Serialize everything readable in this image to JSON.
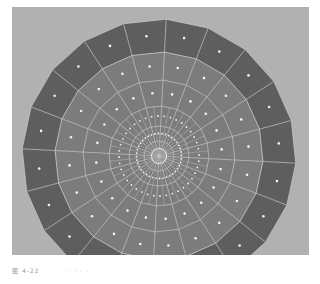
{
  "viewport": {
    "view": "3D mesh viewport - top view of subdivided disc",
    "colors": {
      "background": "#b1b1b1",
      "outer_ring": "#5e5e5e",
      "inner_disc": "#7c7c7c",
      "edges": "#c4c4c4",
      "vertex_dots": "#f2f2f2"
    },
    "mesh": {
      "center": [
        159,
        156
      ],
      "outer_radius": 137,
      "inner_radius": 104,
      "ring_radii": [
        15,
        30,
        50,
        76,
        104,
        137
      ],
      "outer_segments": 20,
      "inner_segments": 40,
      "rotation_deg": 3
    }
  },
  "caption": {
    "label": "图 4-22",
    "text": "· · · ·"
  }
}
